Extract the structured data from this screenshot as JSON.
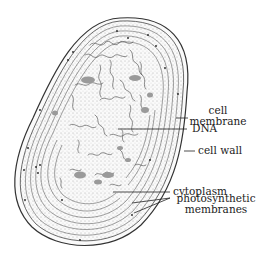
{
  "diagram": {
    "labels": {
      "cell_membrane_line1": "cell",
      "cell_membrane_line2": "membrane",
      "dna": "DNA",
      "cell_wall": "cell wall",
      "cytoplasm": "cytoplasm",
      "photosynthetic_line1": "photosynthetic",
      "photosynthetic_line2": "membranes"
    },
    "colors": {
      "outline": "#333333",
      "stipple": "#555555",
      "granules": "#9a9a9a",
      "background": "#ffffff"
    }
  }
}
